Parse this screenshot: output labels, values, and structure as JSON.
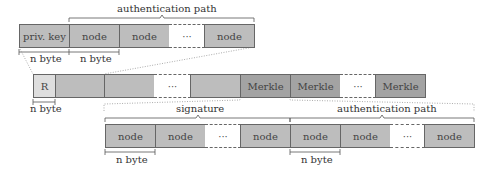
{
  "top_row": {
    "brace_label": "authentication path",
    "cells": [
      {
        "label": "priv. key",
        "kind": "light"
      },
      {
        "label": "node",
        "kind": "light"
      },
      {
        "label": "node",
        "kind": "light"
      },
      {
        "label": "···",
        "kind": "dots"
      },
      {
        "label": "node",
        "kind": "light"
      }
    ],
    "measures": [
      "n byte",
      "n byte"
    ]
  },
  "middle_row": {
    "cells": [
      {
        "label": "R",
        "kind": "pale"
      },
      {
        "label": "",
        "kind": "light"
      },
      {
        "label": "",
        "kind": "light"
      },
      {
        "label": "···",
        "kind": "dots"
      },
      {
        "label": "",
        "kind": "light"
      },
      {
        "label": "Merkle",
        "kind": "dark"
      },
      {
        "label": "Merkle",
        "kind": "dark"
      },
      {
        "label": "···",
        "kind": "dots"
      },
      {
        "label": "Merkle",
        "kind": "dark"
      }
    ],
    "measures": [
      "n byte"
    ]
  },
  "bottom_row": {
    "brace_labels": [
      "signature",
      "authentication path"
    ],
    "cells": [
      {
        "label": "node",
        "kind": "light"
      },
      {
        "label": "node",
        "kind": "light"
      },
      {
        "label": "···",
        "kind": "dots"
      },
      {
        "label": "node",
        "kind": "light"
      },
      {
        "label": "node",
        "kind": "light"
      },
      {
        "label": "node",
        "kind": "light"
      },
      {
        "label": "···",
        "kind": "dots"
      },
      {
        "label": "node",
        "kind": "light"
      }
    ],
    "measures": [
      "n byte",
      "n byte"
    ]
  }
}
